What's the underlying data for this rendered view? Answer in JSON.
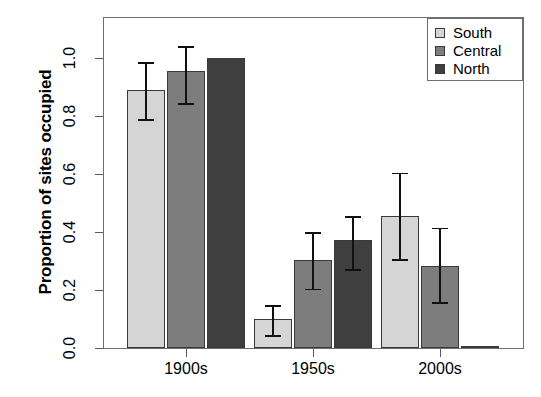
{
  "chart_data": {
    "type": "bar",
    "title": "",
    "xlabel": "",
    "ylabel": "Proportion of sites occupied",
    "categories": [
      "1900s",
      "1950s",
      "2000s"
    ],
    "ylim": [
      0.0,
      1.06
    ],
    "yticks": [
      "0.0",
      "0.2",
      "0.4",
      "0.6",
      "0.8",
      "1.0"
    ],
    "ytick_values": [
      0.0,
      0.2,
      0.4,
      0.6,
      0.8,
      1.0
    ],
    "grid": false,
    "legend_position": "top-right",
    "series": [
      {
        "name": "South",
        "color": "#d5d5d5",
        "values": [
          0.89,
          0.1,
          0.455
        ],
        "err_low": [
          0.79,
          0.045,
          0.307
        ],
        "err_high": [
          0.985,
          0.148,
          0.605
        ]
      },
      {
        "name": "Central",
        "color": "#7d7d7d",
        "values": [
          0.955,
          0.305,
          0.283
        ],
        "err_low": [
          0.845,
          0.205,
          0.158
        ],
        "err_high": [
          1.04,
          0.4,
          0.415
        ]
      },
      {
        "name": "North",
        "color": "#3f3f3f",
        "values": [
          1.0,
          0.372,
          0.005
        ],
        "err_low": [
          1.0,
          0.272,
          0.005
        ],
        "err_high": [
          1.0,
          0.455,
          0.005
        ]
      }
    ]
  },
  "axes": {
    "y_title": "Proportion of sites occupied"
  },
  "legend": {
    "items": [
      {
        "label": "South",
        "color": "#d5d5d5"
      },
      {
        "label": "Central",
        "color": "#7d7d7d"
      },
      {
        "label": "North",
        "color": "#3f3f3f"
      }
    ]
  }
}
